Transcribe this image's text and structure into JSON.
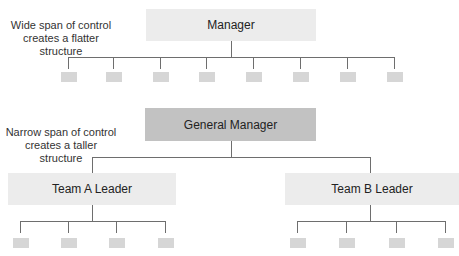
{
  "wide": {
    "caption_line1": "Wide span of control",
    "caption_line2": "creates a flatter structure",
    "root_label": "Manager",
    "subordinate_count": 8
  },
  "narrow": {
    "caption_line1": "Narrow span of control",
    "caption_line2": "creates a taller structure",
    "root_label": "General Manager",
    "leaders": [
      {
        "label": "Team A Leader",
        "subordinate_count": 4
      },
      {
        "label": "Team B Leader",
        "subordinate_count": 4
      }
    ]
  },
  "colors": {
    "light_box": "#ececec",
    "dark_box": "#c2c2c2",
    "connector": "#6e6e6e",
    "leaf_box": "#d6d6d6"
  }
}
